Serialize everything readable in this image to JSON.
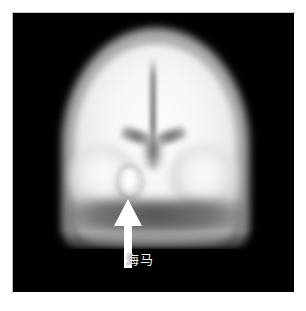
{
  "figure": {
    "kind": "medical-brain-scan",
    "modality_appearance": "grayscale coronal brain perfusion scan",
    "background_color": "#ffffff",
    "panel_color": "#000000"
  },
  "annotation": {
    "arrow": {
      "name": "pointer-arrow",
      "direction": "up",
      "color": "#ffffff",
      "points_to": "hippocampus-hotspot"
    },
    "label": {
      "text": "海马",
      "color": "#f2f2f2"
    }
  },
  "scan": {
    "regions": {
      "scalp": "scalp-skull-ring",
      "cortex": "cerebral-cortex",
      "midline": "interhemispheric-fissure",
      "ventricles": "lateral-ventricles",
      "temporal_left": "left-temporal-lobe",
      "temporal_right": "right-temporal-lobe",
      "hotspot": "hippocampus"
    }
  }
}
